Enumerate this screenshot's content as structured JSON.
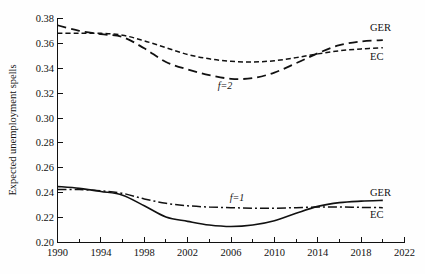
{
  "chart_data": {
    "type": "line",
    "title": "",
    "subtitle": "",
    "xlabel": "",
    "ylabel": "Expected unemployment spells",
    "xlim": [
      1990,
      2022
    ],
    "ylim": [
      0.2,
      0.38
    ],
    "xticks": [
      1990,
      1994,
      1998,
      2002,
      2006,
      2010,
      2014,
      2018,
      2022
    ],
    "xtick_labels": [
      "1990",
      "1994",
      "1998",
      "2002",
      "2006",
      "2010",
      "2014",
      "2018",
      "2022"
    ],
    "x_minor_tick_step": 2,
    "yticks": [
      0.2,
      0.22,
      0.24,
      0.26,
      0.28,
      0.3,
      0.32,
      0.34,
      0.36,
      0.38
    ],
    "ytick_labels": [
      "0.20",
      "0.22",
      "0.24",
      "0.26",
      "0.28",
      "0.30",
      "0.32",
      "0.34",
      "0.36",
      "0.38"
    ],
    "grid": false,
    "legend_position": "inline-right-end",
    "line_color": "#111111",
    "x": [
      1990,
      1992,
      1994,
      1996,
      1998,
      2000,
      2002,
      2004,
      2006,
      2008,
      2010,
      2012,
      2014,
      2016,
      2018,
      2020
    ],
    "series": [
      {
        "name": "GER",
        "group": "f=2",
        "label": "GER",
        "style": "long-dash",
        "values": [
          0.3745,
          0.37,
          0.3673,
          0.365,
          0.356,
          0.345,
          0.339,
          0.3345,
          0.3315,
          0.332,
          0.3365,
          0.344,
          0.352,
          0.3585,
          0.3615,
          0.3625
        ]
      },
      {
        "name": "EC",
        "group": "f=2",
        "label": "EC",
        "style": "short-dash",
        "values": [
          0.368,
          0.368,
          0.368,
          0.3665,
          0.362,
          0.3565,
          0.351,
          0.3475,
          0.3455,
          0.345,
          0.346,
          0.3485,
          0.3515,
          0.354,
          0.3555,
          0.3565
        ]
      },
      {
        "name": "GER",
        "group": "f=1",
        "label": "GER",
        "style": "solid",
        "values": [
          0.245,
          0.2435,
          0.241,
          0.238,
          0.2295,
          0.2205,
          0.217,
          0.214,
          0.2128,
          0.214,
          0.2175,
          0.2235,
          0.229,
          0.232,
          0.2332,
          0.2338
        ]
      },
      {
        "name": "EC",
        "group": "f=1",
        "label": "EC",
        "style": "dash-dot",
        "values": [
          0.2425,
          0.2425,
          0.2415,
          0.2395,
          0.235,
          0.2315,
          0.2295,
          0.2285,
          0.228,
          0.2275,
          0.2275,
          0.228,
          0.2285,
          0.2285,
          0.2282,
          0.228
        ]
      }
    ],
    "annotations": [
      {
        "text": "f=2",
        "x": 2003,
        "y": 0.329
      },
      {
        "text": "f=1",
        "x": 2005,
        "y": 0.2405
      }
    ]
  }
}
